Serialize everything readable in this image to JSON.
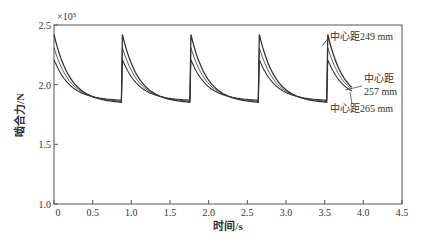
{
  "chart_data": {
    "type": "line",
    "title": "",
    "xlabel": "时间/s",
    "ylabel": "啮合力/N",
    "y_multiplier": "×10⁵",
    "xlim": [
      0,
      4.5
    ],
    "ylim": [
      1.0,
      2.5
    ],
    "xticks": [
      "0",
      "0.5",
      "1.0",
      "1.5",
      "2.0",
      "2.5",
      "3.0",
      "3.5",
      "4.0",
      "4.5"
    ],
    "yticks": [
      "1.0",
      "1.5",
      "2.0",
      "2.5"
    ],
    "period": 0.885,
    "series": [
      {
        "name": "中心距249 mm",
        "peak": 2.42,
        "trough": 1.855,
        "width": 1.3
      },
      {
        "name": "中心距257 mm",
        "peak": 2.31,
        "trough": 1.865,
        "width": 0.8
      },
      {
        "name": "中心距265 mm",
        "peak": 2.21,
        "trough": 1.875,
        "width": 1.1
      }
    ],
    "annotations": [
      {
        "text": "中心距249 mm",
        "x": 330,
        "y": 40
      },
      {
        "text": "中心距",
        "x": 364,
        "y": 82
      },
      {
        "text": "257 mm",
        "x": 364,
        "y": 95
      },
      {
        "text": "中心距265 mm",
        "x": 330,
        "y": 112
      }
    ]
  }
}
